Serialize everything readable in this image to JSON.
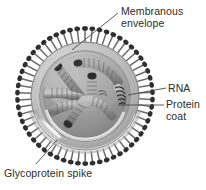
{
  "figure": {
    "background_color": "#ffffff",
    "width": 206,
    "height": 190
  },
  "labels": {
    "membranous_envelope": {
      "line1": "Membranous",
      "line2": "envelope"
    },
    "rna": {
      "line1": "RNA"
    },
    "protein_coat": {
      "line1": "Protein",
      "line2": "coat"
    },
    "glycoprotein_spike": {
      "line1": "Glycoprotein spike"
    }
  },
  "colors": {
    "text": "#2b2b2b",
    "leader_line": "#4a4a4a",
    "envelope_outer": "#b9b9b9",
    "envelope_mid": "#a8a8a8",
    "envelope_inner": "#cfcfcf",
    "interior_fill": "#9d9d9d",
    "nucleocapsid": "#8a8a8a",
    "nucleocapsid_dark": "#3a3a3a",
    "spike_stalk": "#6f6f6f",
    "spike_head": "#2f2f2f",
    "highlight": "#e6e6e6"
  },
  "structure": {
    "virus_center": {
      "x": 85,
      "y": 96
    },
    "envelope_radius": 56,
    "spike_count": 58,
    "nucleocapsid_segments": 7,
    "cutaway": true
  }
}
